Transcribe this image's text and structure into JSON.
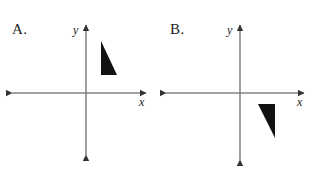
{
  "figure": {
    "background_color": "#ffffff",
    "ink_color": "#222222",
    "shape_fill": "#111111"
  },
  "panels": [
    {
      "id": "a",
      "label": "A.",
      "label_pos": {
        "x": 12,
        "y": 22
      },
      "axes": {
        "origin": {
          "x": 86,
          "y": 93
        },
        "x_axis": {
          "start_x": 12,
          "end_x": 146,
          "y": 93,
          "arrows": "both"
        },
        "y_axis": {
          "x": 86,
          "start_y": 25,
          "end_y": 155,
          "arrows": "both"
        },
        "x_label": "x",
        "x_label_pos": {
          "x": 139,
          "y": 96
        },
        "y_label": "y",
        "y_label_pos": {
          "x": 73,
          "y": 24
        }
      },
      "shape": {
        "name": "right-triangle",
        "quadrant": "I",
        "fill": "#111111",
        "vertices": [
          {
            "x": 101,
            "y": 41
          },
          {
            "x": 101,
            "y": 75
          },
          {
            "x": 117,
            "y": 75
          }
        ],
        "legs": "vertical left leg, horizontal bottom leg, hypotenuse from top-left to bottom-right"
      }
    },
    {
      "id": "b",
      "label": "B.",
      "label_pos": {
        "x": 12,
        "y": 22
      },
      "axes": {
        "origin": {
          "x": 82,
          "y": 93
        },
        "x_axis": {
          "start_x": 8,
          "end_x": 146,
          "y": 93,
          "arrows": "both"
        },
        "y_axis": {
          "x": 82,
          "start_y": 25,
          "end_y": 160,
          "arrows": "both"
        },
        "x_label": "x",
        "x_label_pos": {
          "x": 139,
          "y": 96
        },
        "y_label": "y",
        "y_label_pos": {
          "x": 69,
          "y": 24
        }
      },
      "shape": {
        "name": "right-triangle",
        "quadrant": "IV",
        "fill": "#111111",
        "vertices": [
          {
            "x": 100,
            "y": 104
          },
          {
            "x": 117,
            "y": 104
          },
          {
            "x": 117,
            "y": 138
          }
        ],
        "legs": "horizontal top leg, vertical right leg, hypotenuse from top-left to bottom-right"
      }
    }
  ]
}
